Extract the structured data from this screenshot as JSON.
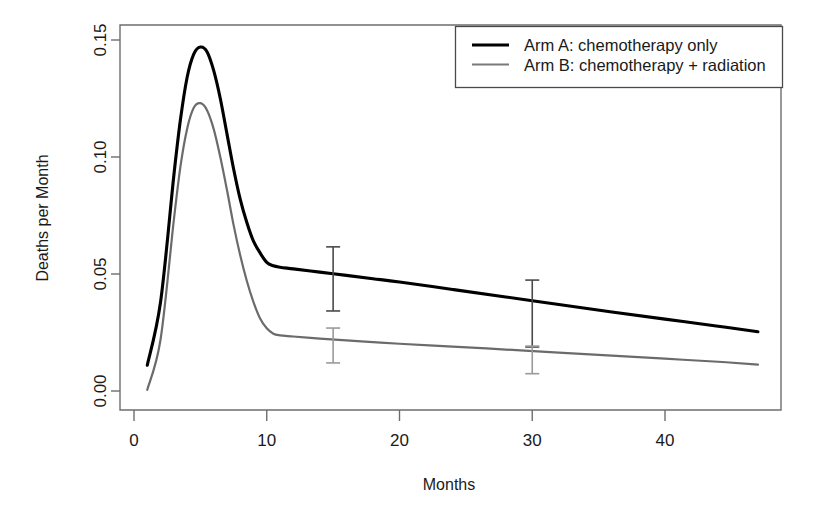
{
  "chart_data": {
    "type": "line",
    "title": "",
    "xlabel": "Months",
    "ylabel": "Deaths per Month",
    "xlim": [
      0,
      48.5
    ],
    "ylim": [
      0.0,
      0.158
    ],
    "grid": false,
    "legend_position": "top-right",
    "xticks": [
      "0",
      "10",
      "20",
      "30",
      "40"
    ],
    "xtick_values": [
      0,
      10,
      20,
      30,
      40
    ],
    "yticks": [
      "0.00",
      "0.05",
      "0.10",
      "0.15"
    ],
    "ytick_values": [
      0.0,
      0.05,
      0.1,
      0.15
    ],
    "series": [
      {
        "name": "Arm A: chemotherapy only",
        "color": "#000000",
        "x": [
          1,
          2,
          3,
          3.5,
          4,
          4.5,
          5,
          5.5,
          6,
          6.5,
          7,
          7.5,
          8,
          8.5,
          9,
          9.5,
          10,
          10.5,
          11,
          12,
          14,
          16,
          18,
          20,
          24,
          28,
          32,
          36,
          40,
          44,
          47
        ],
        "values": [
          0.011,
          0.038,
          0.092,
          0.116,
          0.134,
          0.144,
          0.147,
          0.145,
          0.137,
          0.125,
          0.11,
          0.095,
          0.082,
          0.072,
          0.064,
          0.059,
          0.055,
          0.0535,
          0.0529,
          0.0522,
          0.0508,
          0.0494,
          0.048,
          0.0466,
          0.0434,
          0.0402,
          0.037,
          0.0338,
          0.0307,
          0.0277,
          0.0253
        ]
      },
      {
        "name": "Arm B: chemotherapy + radiation",
        "color": "#6b6b6b",
        "x": [
          1,
          2,
          3,
          3.5,
          4,
          4.5,
          5,
          5.5,
          6,
          6.5,
          7,
          7.5,
          8,
          8.5,
          9,
          9.5,
          10,
          10.5,
          11,
          12,
          14,
          16,
          18,
          20,
          24,
          28,
          32,
          36,
          40,
          44,
          47
        ],
        "values": [
          0.0005,
          0.022,
          0.073,
          0.096,
          0.112,
          0.121,
          0.123,
          0.12,
          0.112,
          0.1,
          0.086,
          0.071,
          0.058,
          0.047,
          0.038,
          0.031,
          0.0268,
          0.0245,
          0.0238,
          0.0233,
          0.0224,
          0.0216,
          0.0209,
          0.0202,
          0.019,
          0.0177,
          0.0164,
          0.0151,
          0.0138,
          0.0125,
          0.0113
        ]
      }
    ],
    "error_bars": [
      {
        "series": "Arm A: chemotherapy only",
        "x": 15,
        "y": 0.0494,
        "low": 0.0342,
        "high": 0.0616,
        "color": "#4a4a4a"
      },
      {
        "series": "Arm B: chemotherapy + radiation",
        "x": 15,
        "y": 0.0221,
        "low": 0.012,
        "high": 0.0269,
        "color": "#9a9a9a"
      },
      {
        "series": "Arm A: chemotherapy only",
        "x": 30,
        "y": 0.0386,
        "low": 0.0188,
        "high": 0.0474,
        "color": "#4a4a4a"
      },
      {
        "series": "Arm B: chemotherapy + radiation",
        "x": 30,
        "y": 0.0172,
        "low": 0.0074,
        "high": 0.0192,
        "color": "#9a9a9a"
      }
    ],
    "legend": [
      {
        "label": "Arm A: chemotherapy only",
        "color": "#000000",
        "width": 3.2
      },
      {
        "label": "Arm B: chemotherapy + radiation",
        "color": "#7a7a7a",
        "width": 2.0
      }
    ]
  }
}
